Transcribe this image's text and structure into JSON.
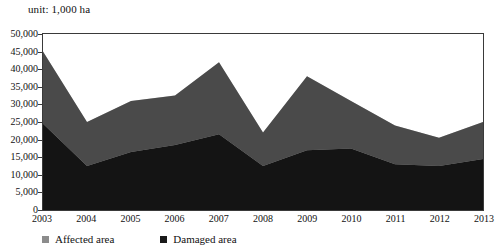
{
  "unit_caption": "unit: 1,000 ha",
  "axes": {
    "y_ticks": [
      "50,000",
      "45,000",
      "40,000",
      "35,000",
      "30,000",
      "25,000",
      "20,000",
      "15,000",
      "10,000",
      "5,000",
      "0"
    ],
    "x_ticks": [
      "2003",
      "2004",
      "2005",
      "2006",
      "2007",
      "2008",
      "2009",
      "2010",
      "2011",
      "2012",
      "2013"
    ]
  },
  "legend": {
    "items": [
      {
        "label": "Affected area",
        "color": "#8c8c8c"
      },
      {
        "label": "Damaged area",
        "color": "#1a1a1a"
      }
    ]
  },
  "colors": {
    "affected_fill": "#c9c9c9",
    "mid_band_fill": "#4a4a4a",
    "damaged_fill": "#141414",
    "frame": "#3a3a3a",
    "text": "#111111"
  },
  "chart_data": {
    "type": "area",
    "title": "",
    "subtitle": "",
    "xlabel": "",
    "ylabel": "",
    "unit": "1,000 ha",
    "ylim": [
      0,
      50000
    ],
    "y_tick_step": 5000,
    "grid": false,
    "legend_position": "bottom-left",
    "categories": [
      "2003",
      "2004",
      "2005",
      "2006",
      "2007",
      "2008",
      "2009",
      "2010",
      "2011",
      "2012",
      "2013"
    ],
    "series": [
      {
        "name": "Affected area",
        "color": "#8c8c8c",
        "values": [
          45000,
          25000,
          31000,
          32500,
          42000,
          22000,
          38000,
          31000,
          24000,
          20500,
          25000
        ]
      },
      {
        "name": "Damaged area",
        "color": "#1a1a1a",
        "values": [
          24500,
          12500,
          16500,
          18500,
          21500,
          12500,
          17000,
          17500,
          13000,
          12500,
          14500
        ]
      }
    ]
  }
}
